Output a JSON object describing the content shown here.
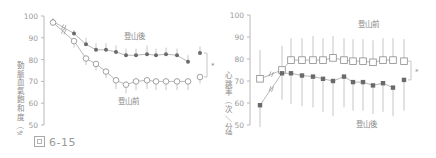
{
  "figure": {
    "caption_prefix": "圖",
    "caption_number": "6-15"
  },
  "chart_data": [
    {
      "type": "line",
      "title": "",
      "xlabel": "",
      "ylabel": "動脈血氧飽和度（%）",
      "ylim": [
        50,
        100
      ],
      "yticks": [
        100,
        90,
        80,
        70,
        60,
        50
      ],
      "grid": false,
      "x_index": [
        1,
        2,
        3,
        4,
        5,
        6,
        7,
        8,
        9,
        10,
        11,
        12,
        13
      ],
      "series": [
        {
          "name": "登山後",
          "marker": "filled-circle",
          "values": [
            97.5,
            92,
            87,
            84.5,
            84.5,
            83.5,
            82,
            82,
            82.5,
            82,
            82.5,
            82,
            79
          ],
          "error_up": [
            1.5,
            1.5,
            3,
            3,
            3,
            3,
            3,
            3,
            4,
            3,
            3,
            3,
            3
          ],
          "summary_value": 83,
          "summary_error": 3
        },
        {
          "name": "登山前",
          "marker": "open-circle",
          "values": [
            97,
            88.5,
            80.5,
            78,
            74.5,
            70.5,
            68.5,
            70,
            70.5,
            70,
            70,
            70,
            70
          ],
          "error_down": [
            1.5,
            3,
            3,
            3,
            3,
            4,
            4,
            4,
            4,
            4,
            4,
            4,
            4
          ],
          "summary_value": 72,
          "summary_error": 3
        }
      ],
      "annotations": [
        "登山後",
        "登山前",
        "*"
      ]
    },
    {
      "type": "line",
      "title": "",
      "xlabel": "",
      "ylabel": "心跳率（次／分鐘）",
      "ylim": [
        50,
        100
      ],
      "yticks": [
        100,
        90,
        80,
        70,
        60,
        50
      ],
      "grid": false,
      "x_index": [
        1,
        2,
        3,
        4,
        5,
        6,
        7,
        8,
        9,
        10,
        11,
        12,
        13
      ],
      "series": [
        {
          "name": "登山前",
          "marker": "open-square",
          "values": [
            71,
            75,
            79.5,
            79.5,
            79.5,
            79.5,
            80.5,
            79.5,
            79,
            79,
            78.5,
            79.5,
            79.5
          ],
          "error_up": [
            13,
            11,
            10,
            10,
            11,
            10,
            10,
            10,
            10,
            10,
            10,
            10,
            10
          ],
          "summary_value": 79,
          "summary_error": 10
        },
        {
          "name": "登山後",
          "marker": "filled-square",
          "values": [
            59,
            73.5,
            73.5,
            72.5,
            72,
            71,
            70,
            72,
            69.5,
            69.5,
            68,
            69,
            67
          ],
          "error_down": [
            10,
            12,
            14,
            14,
            14,
            15,
            16,
            14,
            13,
            13,
            13,
            13,
            13
          ],
          "summary_value": 70.5,
          "summary_error": 14
        }
      ],
      "annotations": [
        "登山前",
        "登山後",
        "*"
      ]
    }
  ],
  "labels": {
    "left_top": "登山後",
    "left_bottom": "登山前",
    "right_top": "登山前",
    "right_bottom": "登山後",
    "significance": "*"
  }
}
